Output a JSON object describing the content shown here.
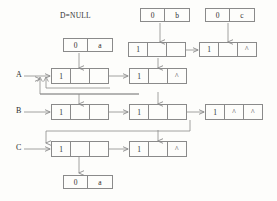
{
  "diagram": {
    "annotations": [
      {
        "id": "d-null",
        "text": "D=NULL",
        "x": 60,
        "y": 11
      }
    ],
    "row_labels": [
      {
        "id": "row-a",
        "text": "A",
        "x": 16,
        "y": 74
      },
      {
        "id": "row-b",
        "text": "B",
        "x": 16,
        "y": 110
      },
      {
        "id": "row-c",
        "text": "C",
        "x": 16,
        "y": 147
      }
    ],
    "nodes": [
      {
        "id": "head-0a-top",
        "name": "head-node-0-a-upper",
        "x": 63,
        "y": 38,
        "w": 50,
        "h": 14,
        "cells": [
          {
            "text": "0",
            "w": 25
          },
          {
            "text": "a",
            "w": 25
          }
        ]
      },
      {
        "id": "head-0b",
        "name": "head-node-0-b",
        "x": 140,
        "y": 8,
        "w": 50,
        "h": 14,
        "cells": [
          {
            "text": "0",
            "w": 25
          },
          {
            "text": "b",
            "w": 25
          }
        ]
      },
      {
        "id": "head-0c",
        "name": "head-node-0-c",
        "x": 205,
        "y": 8,
        "w": 50,
        "h": 14,
        "cells": [
          {
            "text": "0",
            "w": 25
          },
          {
            "text": "c",
            "w": 25
          }
        ]
      },
      {
        "id": "node-r0-c1",
        "name": "node-row0-col1",
        "x": 128,
        "y": 42,
        "w": 58,
        "h": 15,
        "cells": [
          {
            "text": "1",
            "w": 20
          },
          {
            "text": "",
            "w": 19
          },
          {
            "text": "",
            "w": 19
          }
        ]
      },
      {
        "id": "node-r0-c2",
        "name": "node-row0-col2",
        "x": 199,
        "y": 42,
        "w": 58,
        "h": 15,
        "cells": [
          {
            "text": "1",
            "w": 20
          },
          {
            "text": "",
            "w": 19
          },
          {
            "text": "^",
            "w": 19
          }
        ]
      },
      {
        "id": "node-a1",
        "name": "node-row-a-col1",
        "x": 51,
        "y": 68,
        "w": 58,
        "h": 16,
        "cells": [
          {
            "text": "1",
            "w": 20
          },
          {
            "text": "",
            "w": 19
          },
          {
            "text": "",
            "w": 19
          }
        ]
      },
      {
        "id": "node-a2",
        "name": "node-row-a-col2",
        "x": 129,
        "y": 68,
        "w": 58,
        "h": 16,
        "cells": [
          {
            "text": "1",
            "w": 20
          },
          {
            "text": "",
            "w": 19
          },
          {
            "text": "^",
            "w": 19
          }
        ]
      },
      {
        "id": "node-b1",
        "name": "node-row-b-col1",
        "x": 51,
        "y": 104,
        "w": 58,
        "h": 16,
        "cells": [
          {
            "text": "1",
            "w": 20
          },
          {
            "text": "",
            "w": 19
          },
          {
            "text": "",
            "w": 19
          }
        ]
      },
      {
        "id": "node-b2",
        "name": "node-row-b-col2",
        "x": 129,
        "y": 104,
        "w": 58,
        "h": 16,
        "cells": [
          {
            "text": "1",
            "w": 20
          },
          {
            "text": "",
            "w": 19
          },
          {
            "text": "",
            "w": 19
          }
        ]
      },
      {
        "id": "node-b3",
        "name": "node-row-b-col3",
        "x": 205,
        "y": 104,
        "w": 58,
        "h": 16,
        "cells": [
          {
            "text": "1",
            "w": 20
          },
          {
            "text": "^",
            "w": 19
          },
          {
            "text": "^",
            "w": 19
          }
        ]
      },
      {
        "id": "node-c1",
        "name": "node-row-c-col1",
        "x": 51,
        "y": 141,
        "w": 58,
        "h": 16,
        "cells": [
          {
            "text": "1",
            "w": 20
          },
          {
            "text": "",
            "w": 19
          },
          {
            "text": "",
            "w": 19
          }
        ]
      },
      {
        "id": "node-c2",
        "name": "node-row-c-col2",
        "x": 129,
        "y": 141,
        "w": 58,
        "h": 16,
        "cells": [
          {
            "text": "1",
            "w": 20
          },
          {
            "text": "",
            "w": 19
          },
          {
            "text": "^",
            "w": 19
          }
        ]
      },
      {
        "id": "head-0a-bottom",
        "name": "head-node-0-a-lower",
        "x": 63,
        "y": 175,
        "w": 50,
        "h": 14,
        "cells": [
          {
            "text": "0",
            "w": 25
          },
          {
            "text": "a",
            "w": 25
          }
        ]
      }
    ],
    "colors": {
      "stroke": "#8a8a8a",
      "text": "#2b2b2b",
      "background": "#fdfdfb"
    }
  }
}
